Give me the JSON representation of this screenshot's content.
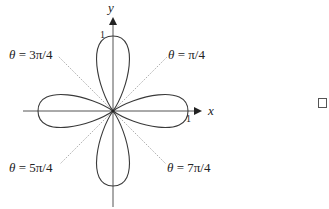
{
  "diagram": {
    "type": "polar-rose",
    "equation_hint": "four-leaved rose",
    "axes": {
      "x_label": "x",
      "y_label": "y",
      "x_tick": "1",
      "y_tick": "1"
    },
    "rays": [
      {
        "theta": "θ",
        "eq": " = ",
        "value": "3π/4"
      },
      {
        "theta": "θ",
        "eq": " = ",
        "value": "π/4"
      },
      {
        "theta": "θ",
        "eq": " = ",
        "value": "5π/4"
      },
      {
        "theta": "θ",
        "eq": " = ",
        "value": "7π/4"
      }
    ],
    "petals": 4,
    "end_symbol": "□",
    "colors": {
      "curve": "#3a3a3a",
      "axis": "#555555",
      "ray": "#888888",
      "text": "#222222"
    }
  }
}
